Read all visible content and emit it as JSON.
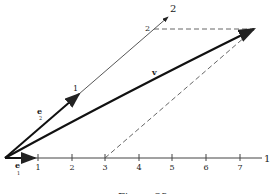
{
  "figure": {
    "caption": "Figure 23",
    "axis1": {
      "label": "1",
      "ticks": [
        "1",
        "2",
        "3",
        "4",
        "5",
        "6",
        "7"
      ]
    },
    "axis2": {
      "label": "2",
      "ticks": [
        "1",
        "2"
      ]
    },
    "vectors": {
      "e1": "e",
      "e1_sub": "1",
      "e2": "e",
      "e2_sub": "2",
      "v": "v"
    }
  }
}
